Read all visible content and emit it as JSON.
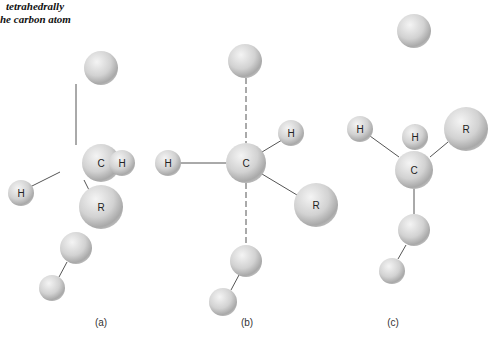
{
  "caption": {
    "line1": "tetrahedrally",
    "line2": "he carbon atom"
  },
  "colors": {
    "atom_light": "#efefef",
    "atom_mid": "#c8c8c8",
    "atom_dark": "#9a9a9a",
    "bond": "#555555",
    "background": "#ffffff"
  },
  "panels": [
    {
      "label": "(a)",
      "label_pos": [
        101,
        326
      ],
      "atoms": [
        {
          "x": 101,
          "y": 68,
          "r": 17,
          "label": ""
        },
        {
          "x": 101,
          "y": 163,
          "r": 19,
          "label": "C"
        },
        {
          "x": 122,
          "y": 163,
          "r": 13,
          "label": "H"
        },
        {
          "x": 21,
          "y": 193,
          "r": 13,
          "label": "H"
        },
        {
          "x": 101,
          "y": 207,
          "r": 22,
          "label": "R"
        },
        {
          "x": 76,
          "y": 248,
          "r": 16,
          "label": ""
        },
        {
          "x": 52,
          "y": 288,
          "r": 13,
          "label": ""
        }
      ],
      "bonds": [
        {
          "x1": 76,
          "y1": 84,
          "x2": 76,
          "y2": 145,
          "dashed": false
        },
        {
          "x1": 95,
          "y1": 163,
          "x2": 111,
          "y2": 163,
          "dashed": false
        },
        {
          "x1": 60,
          "y1": 172,
          "x2": 30,
          "y2": 187,
          "dashed": false
        },
        {
          "x1": 84,
          "y1": 180,
          "x2": 89,
          "y2": 190,
          "dashed": false
        },
        {
          "x1": 67,
          "y1": 262,
          "x2": 59,
          "y2": 277,
          "dashed": false
        }
      ]
    },
    {
      "label": "(b)",
      "label_pos": [
        247,
        326
      ],
      "atoms": [
        {
          "x": 245,
          "y": 61,
          "r": 17,
          "label": ""
        },
        {
          "x": 246,
          "y": 163,
          "r": 20,
          "label": "C"
        },
        {
          "x": 291,
          "y": 133,
          "r": 13,
          "label": "H"
        },
        {
          "x": 168,
          "y": 163,
          "r": 13,
          "label": "H"
        },
        {
          "x": 316,
          "y": 205,
          "r": 22,
          "label": "R"
        },
        {
          "x": 246,
          "y": 261,
          "r": 16,
          "label": ""
        },
        {
          "x": 223,
          "y": 302,
          "r": 14,
          "label": ""
        }
      ],
      "bonds": [
        {
          "x1": 246,
          "y1": 78,
          "x2": 246,
          "y2": 143,
          "dashed": true
        },
        {
          "x1": 246,
          "y1": 183,
          "x2": 246,
          "y2": 245,
          "dashed": true
        },
        {
          "x1": 262,
          "y1": 152,
          "x2": 282,
          "y2": 140,
          "dashed": false
        },
        {
          "x1": 181,
          "y1": 163,
          "x2": 226,
          "y2": 163,
          "dashed": false
        },
        {
          "x1": 262,
          "y1": 174,
          "x2": 297,
          "y2": 195,
          "dashed": false
        },
        {
          "x1": 239,
          "y1": 275,
          "x2": 231,
          "y2": 290,
          "dashed": false
        }
      ]
    },
    {
      "label": "(c)",
      "label_pos": [
        393,
        326
      ],
      "atoms": [
        {
          "x": 414,
          "y": 31,
          "r": 17,
          "label": ""
        },
        {
          "x": 415,
          "y": 137,
          "r": 13,
          "label": "H"
        },
        {
          "x": 360,
          "y": 129,
          "r": 13,
          "label": "H"
        },
        {
          "x": 466,
          "y": 129,
          "r": 22,
          "label": "R"
        },
        {
          "x": 414,
          "y": 170,
          "r": 19,
          "label": "C"
        },
        {
          "x": 414,
          "y": 230,
          "r": 16,
          "label": ""
        },
        {
          "x": 392,
          "y": 271,
          "r": 13,
          "label": ""
        }
      ],
      "bonds": [
        {
          "x1": 415,
          "y1": 124,
          "x2": 415,
          "y2": 150,
          "dashed": false
        },
        {
          "x1": 370,
          "y1": 136,
          "x2": 399,
          "y2": 157,
          "dashed": false
        },
        {
          "x1": 448,
          "y1": 142,
          "x2": 430,
          "y2": 157,
          "dashed": false
        },
        {
          "x1": 414,
          "y1": 189,
          "x2": 414,
          "y2": 214,
          "dashed": false
        },
        {
          "x1": 406,
          "y1": 245,
          "x2": 398,
          "y2": 259,
          "dashed": false
        }
      ]
    }
  ]
}
